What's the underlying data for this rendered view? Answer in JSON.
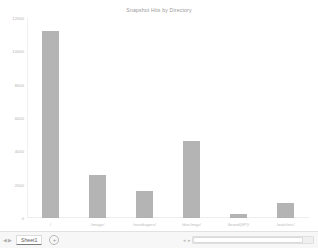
{
  "chart_data": {
    "type": "bar",
    "title": "Snapshot Hits by Directory",
    "xlabel": "",
    "ylabel": "",
    "categories": [
      "/",
      "/image/",
      "/wordtagers/",
      "/doc/imgs/",
      "/brand(SP)/",
      "/watches/"
    ],
    "values": [
      11200,
      2600,
      1600,
      4600,
      250,
      900
    ],
    "ylim": [
      0,
      12000
    ],
    "yticks": [
      0,
      2000,
      4000,
      6000,
      8000,
      10000,
      12000
    ],
    "ytick_labels": [
      "0",
      "2000",
      "4000",
      "6000",
      "8000",
      "10000",
      "12000"
    ],
    "grid": false,
    "legend": "none",
    "bar_color": "#a3a3a3"
  },
  "statusbar": {
    "prev_arrow": "◀",
    "next_arrow": "▶",
    "sheet_tab": "Sheet1",
    "add_sheet": "+",
    "scroll_left": "◂",
    "scroll_right": "▸"
  }
}
